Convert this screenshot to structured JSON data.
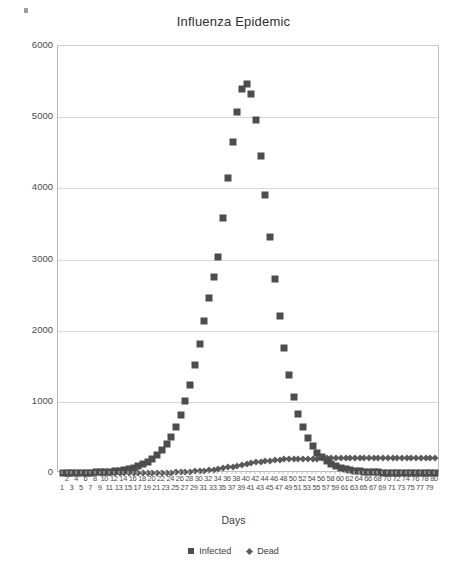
{
  "chart_data": {
    "type": "scatter",
    "title": "Influenza Epidemic",
    "xlabel": "Days",
    "ylabel": "",
    "xlim": [
      1,
      80
    ],
    "ylim": [
      0,
      6000
    ],
    "grid": true,
    "legend_position": "bottom",
    "ytick_labels": [
      "0",
      "1000",
      "2000",
      "3000",
      "4000",
      "5000",
      "6000"
    ],
    "ytick_values": [
      0,
      1000,
      2000,
      3000,
      4000,
      5000,
      6000
    ],
    "x": [
      1,
      2,
      3,
      4,
      5,
      6,
      7,
      8,
      9,
      10,
      11,
      12,
      13,
      14,
      15,
      16,
      17,
      18,
      19,
      20,
      21,
      22,
      23,
      24,
      25,
      26,
      27,
      28,
      29,
      30,
      31,
      32,
      33,
      34,
      35,
      36,
      37,
      38,
      39,
      40,
      41,
      42,
      43,
      44,
      45,
      46,
      47,
      48,
      49,
      50,
      51,
      52,
      53,
      54,
      55,
      56,
      57,
      58,
      59,
      60,
      61,
      62,
      63,
      64,
      65,
      66,
      67,
      68,
      69,
      70,
      71,
      72,
      73,
      74,
      75,
      76,
      77,
      78,
      79,
      80
    ],
    "xtick_labels_even": [
      "2",
      "4",
      "6",
      "8",
      "10",
      "12",
      "14",
      "16",
      "18",
      "20",
      "22",
      "24",
      "26",
      "28",
      "30",
      "32",
      "34",
      "36",
      "38",
      "40",
      "42",
      "44",
      "46",
      "48",
      "50",
      "52",
      "54",
      "56",
      "58",
      "60",
      "62",
      "64",
      "66",
      "68",
      "70",
      "72",
      "74",
      "76",
      "78",
      "80"
    ],
    "xtick_labels_odd": [
      "1",
      "3",
      "5",
      "7",
      "9",
      "11",
      "13",
      "15",
      "17",
      "19",
      "21",
      "23",
      "25",
      "27",
      "29",
      "31",
      "33",
      "35",
      "37",
      "39",
      "41",
      "43",
      "45",
      "47",
      "49",
      "51",
      "53",
      "55",
      "57",
      "59",
      "61",
      "63",
      "65",
      "67",
      "69",
      "71",
      "73",
      "75",
      "77",
      "79"
    ],
    "series": [
      {
        "name": "Infected",
        "marker": "square",
        "color": "#4d4d4d",
        "values": [
          1,
          1,
          2,
          3,
          4,
          5,
          7,
          9,
          12,
          16,
          20,
          26,
          34,
          44,
          57,
          73,
          94,
          120,
          154,
          197,
          251,
          319,
          405,
          512,
          645,
          808,
          1005,
          1239,
          1511,
          1815,
          2140,
          2465,
          2757,
          3030,
          3580,
          4140,
          4650,
          5070,
          5400,
          5460,
          5330,
          4960,
          4460,
          3900,
          3320,
          2720,
          2200,
          1750,
          1380,
          1070,
          830,
          640,
          490,
          375,
          287,
          219,
          167,
          127,
          97,
          74,
          56,
          43,
          33,
          25,
          19,
          14,
          11,
          8,
          6,
          5,
          4,
          3,
          2,
          2,
          1,
          1,
          1,
          1,
          1,
          1
        ]
      },
      {
        "name": "Dead",
        "marker": "diamond",
        "color": "#5a5a5a",
        "values": [
          0,
          0,
          0,
          0,
          0,
          0,
          0,
          0,
          0,
          0,
          0,
          0,
          0,
          0,
          0,
          1,
          1,
          1,
          2,
          2,
          3,
          4,
          5,
          7,
          9,
          11,
          14,
          18,
          22,
          27,
          33,
          40,
          48,
          57,
          67,
          78,
          90,
          102,
          115,
          127,
          139,
          150,
          160,
          168,
          175,
          181,
          186,
          190,
          193,
          196,
          198,
          200,
          201,
          202,
          203,
          204,
          204,
          205,
          205,
          205,
          206,
          206,
          206,
          206,
          206,
          206,
          206,
          206,
          207,
          207,
          207,
          207,
          207,
          207,
          207,
          207,
          207,
          207,
          207,
          207
        ]
      }
    ]
  },
  "legend": {
    "items": [
      {
        "label": "Infected",
        "marker": "square"
      },
      {
        "label": "Dead",
        "marker": "diamond"
      }
    ]
  }
}
